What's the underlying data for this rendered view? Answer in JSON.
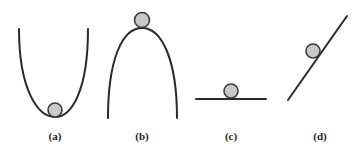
{
  "diagram": {
    "panels": [
      {
        "id": "a",
        "label": "(a)",
        "surface": "concave-up valley",
        "ball_position": "bottom of valley"
      },
      {
        "id": "b",
        "label": "(b)",
        "surface": "concave-down hill",
        "ball_position": "top of hill"
      },
      {
        "id": "c",
        "label": "(c)",
        "surface": "flat horizontal line",
        "ball_position": "resting on line"
      },
      {
        "id": "d",
        "label": "(d)",
        "surface": "inclined straight line",
        "ball_position": "on slope"
      }
    ],
    "colors": {
      "line": "#2a2a2a",
      "ball_fill": "#c9c9c9",
      "ball_stroke": "#3a3a3a",
      "background": "#ffffff"
    }
  }
}
